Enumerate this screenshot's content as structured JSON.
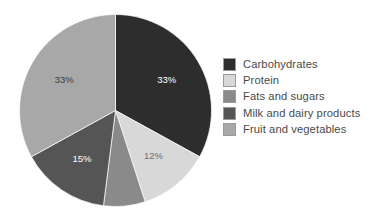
{
  "chart_data": {
    "type": "pie",
    "title": "",
    "categories": [
      "Carbohydrates",
      "Protein",
      "Fats and sugars",
      "Milk and dairy products",
      "Fruit and vegetables"
    ],
    "values": [
      33,
      12,
      7,
      15,
      33
    ],
    "value_labels": [
      "33%",
      "12%",
      "",
      "15%",
      "33%"
    ],
    "colors": [
      "#2d2d2d",
      "#d8d8d8",
      "#8a8a8a",
      "#555555",
      "#a8a8a8"
    ],
    "label_text_colors": [
      "#ffffff",
      "#6f6f6f",
      "",
      "#ffffff",
      "#3c3c3c"
    ],
    "legend_position": "right",
    "start_angle_deg": 0,
    "direction": "clockwise",
    "grid": false,
    "xlabel": "",
    "ylabel": ""
  },
  "legend": {
    "items": [
      {
        "label": "Carbohydrates",
        "color": "#2d2d2d"
      },
      {
        "label": "Protein",
        "color": "#d8d8d8"
      },
      {
        "label": "Fats and sugars",
        "color": "#8a8a8a"
      },
      {
        "label": "Milk and dairy products",
        "color": "#555555"
      },
      {
        "label": "Fruit and vegetables",
        "color": "#a8a8a8"
      }
    ]
  },
  "pie": {
    "slices": [
      {
        "name": "Carbohydrates",
        "percent": "33%",
        "label": "33%"
      },
      {
        "name": "Protein",
        "percent": "12%",
        "label": "12%"
      },
      {
        "name": "Fats and sugars",
        "percent": "7%",
        "label": ""
      },
      {
        "name": "Milk and dairy products",
        "percent": "15%",
        "label": "15%"
      },
      {
        "name": "Fruit and vegetables",
        "percent": "33%",
        "label": "33%"
      }
    ]
  }
}
